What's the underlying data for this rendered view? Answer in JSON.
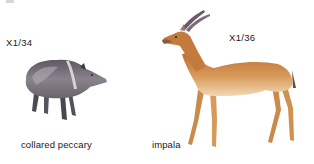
{
  "figures": [
    {
      "name": "collared peccary",
      "scale": "X1/34",
      "colors": {
        "body": "#6e6870",
        "body_light": "#b8b0b8",
        "collar": "#d8d2d8",
        "dark": "#3e3a40"
      }
    },
    {
      "name": "impala",
      "scale": "X1/36",
      "colors": {
        "body": "#c9803f",
        "body_light": "#e6b37a",
        "belly": "#f4e2c4",
        "horn": "#6a5a6a",
        "dark": "#5a3a20"
      }
    }
  ]
}
